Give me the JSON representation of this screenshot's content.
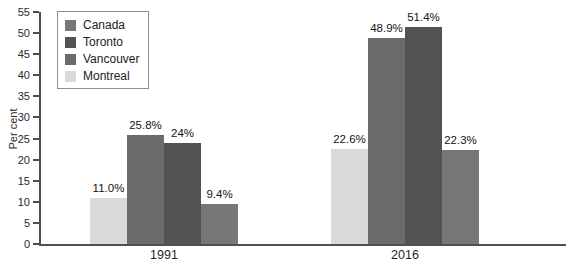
{
  "chart_data": {
    "type": "bar",
    "title": "",
    "ylabel": "Per cent",
    "xlabel": "",
    "ylim": [
      0,
      55
    ],
    "ytick_step": 5,
    "grid": false,
    "legend_position": "top-left",
    "categories": [
      "1991",
      "2016"
    ],
    "series": [
      {
        "name": "Montreal",
        "color": "#d9d9d9",
        "values": [
          11.0,
          22.6
        ],
        "display": [
          "11.0%",
          "22.6%"
        ]
      },
      {
        "name": "Vancouver",
        "color": "#6b6b6b",
        "values": [
          25.8,
          48.9
        ],
        "display": [
          "25.8%",
          "48.9%"
        ]
      },
      {
        "name": "Toronto",
        "color": "#525252",
        "values": [
          24,
          51.4
        ],
        "display": [
          "24%",
          "51.4%"
        ]
      },
      {
        "name": "Canada",
        "color": "#777777",
        "values": [
          9.4,
          22.3
        ],
        "display": [
          "9.4%",
          "22.3%"
        ]
      }
    ],
    "legend_entries": [
      "Canada",
      "Toronto",
      "Vancouver",
      "Montreal"
    ]
  },
  "colors": {
    "axis": "#4f4f4f",
    "tick_text": "#2a2a2a",
    "value_text": "#141414",
    "legend_border": "#8f8f8f",
    "background": "#ffffff"
  }
}
